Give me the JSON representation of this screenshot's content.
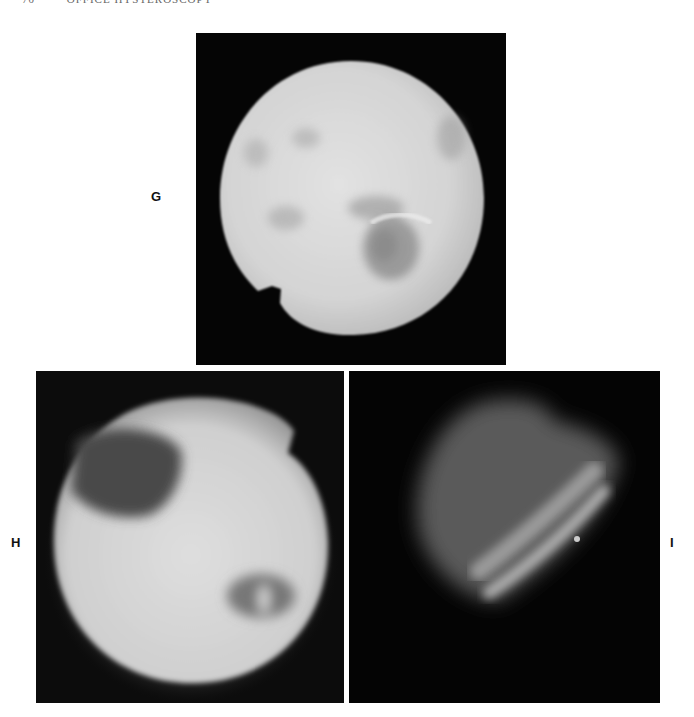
{
  "header": {
    "page_number": "70",
    "running_title": "OFFICE HYSTEROSCOPY"
  },
  "figure": {
    "panels": [
      {
        "id": "G",
        "label": "G",
        "description": "endoscopic view, bright circular field with tubal ostium depression"
      },
      {
        "id": "H",
        "label": "H",
        "description": "endoscopic view, circular field with dark recess upper-left and ostium lower-right"
      },
      {
        "id": "I",
        "label": "I",
        "description": "dim endoscopic view with diagonal folded tissue"
      }
    ]
  },
  "colors": {
    "background": "#ffffff",
    "panel_background": "#050505",
    "label_text": "#111111"
  }
}
